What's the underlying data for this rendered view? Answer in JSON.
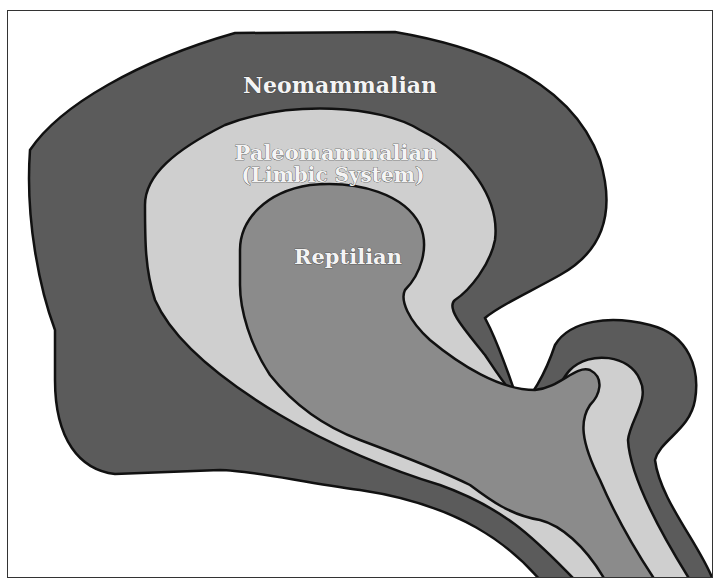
{
  "diagram": {
    "type": "triune-brain",
    "regions": [
      {
        "id": "neomammalian",
        "label_lines": [
          "Neomammalian"
        ],
        "color": "#5b5b5b"
      },
      {
        "id": "paleomammalian",
        "label_lines": [
          "Paleomammalian",
          "(Limbic System)"
        ],
        "color": "#cfcfcf"
      },
      {
        "id": "reptilian",
        "label_lines": [
          "Reptilian"
        ],
        "color": "#8b8b8b"
      }
    ],
    "outline_color": "#111111",
    "background_color": "#ffffff",
    "frame_color": "#333333"
  }
}
